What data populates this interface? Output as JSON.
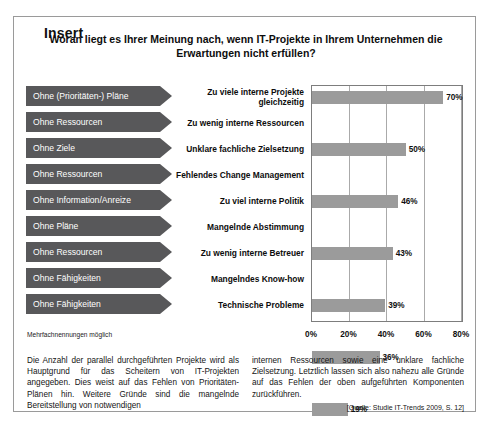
{
  "frame": {
    "legend": "Insert"
  },
  "chart_heading": "Woran liegt es Ihrer Meinung nach, wenn IT-Projekte in Ihrem Unternehmen die Erwartungen nicht erfüllen?",
  "footnote": "Mehrfachnennungen möglich",
  "tags": [
    "Ohne (Prioritäten-) Pläne",
    "Ohne Ressourcen",
    "Ohne Ziele",
    "Ohne Ressourcen",
    "Ohne Information/Anreize",
    "Ohne Pläne",
    "Ohne Ressourcen",
    "Ohne Fähigkeiten",
    "Ohne Fähigkeiten"
  ],
  "chart_data": {
    "type": "bar",
    "orientation": "horizontal",
    "title": "Woran liegt es Ihrer Meinung nach, wenn IT-Projekte in Ihrem Unternehmen die Erwartungen nicht erfüllen?",
    "xlabel": "",
    "ylabel": "",
    "xlim": [
      0,
      80
    ],
    "grid": true,
    "legend": "none",
    "bar_color": "#9b9b9b",
    "categories": [
      "Zu viele interne Projekte gleichzeitig",
      "Zu wenig interne Ressourcen",
      "Unklare fachliche Zielsetzung",
      "Fehlendes Change Management",
      "Zu viel interne Politik",
      "Mangelnde Abstimmung",
      "Zu wenig interne Betreuer",
      "Mangelndes Know-how",
      "Technische Probleme"
    ],
    "values": [
      70,
      50,
      46,
      43,
      39,
      36,
      19,
      15,
      7
    ],
    "value_labels": [
      "70%",
      "50%",
      "46%",
      "43%",
      "39%",
      "36%",
      "19%",
      "15%",
      "7%"
    ],
    "xticks": [
      0,
      20,
      40,
      60,
      80
    ],
    "xtick_labels": [
      "0%",
      "20%",
      "40%",
      "60%",
      "80%"
    ]
  },
  "body": {
    "left_paragraph": "Die Anzahl der parallel durchgeführten Projekte wird als Hauptgrund für das Scheitern von IT-Projekten angegeben. Dies weist auf das Fehlen von Prioritäten-Plänen hin. Weitere Gründe sind die mangelnde Bereitstellung von notwendigen",
    "right_paragraph": "internen Ressourcen sowie eine unklare fachliche Zielsetzung. Letztlich lassen sich also nahezu alle Gründe auf das Fehlen der oben aufgeführten Komponenten zurückführen.",
    "source": "[Quelle: Studie IT-Trends 2009, S. 12]"
  }
}
